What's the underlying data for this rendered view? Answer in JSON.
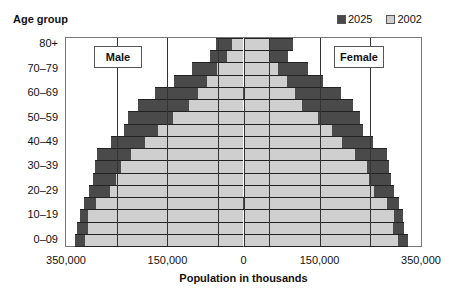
{
  "chart_data": {
    "type": "bar",
    "subtype": "population-pyramid",
    "title": "",
    "ylabel": "Age group",
    "xlabel": "Population in thousands",
    "x_ticks": [
      "350,000",
      "150,000",
      "0",
      "150,000",
      "350,000"
    ],
    "x_tick_values": [
      -350000,
      -150000,
      0,
      150000,
      350000
    ],
    "xlim": [
      -350000,
      350000
    ],
    "gridlines_at": [
      -250000,
      -150000,
      -50000,
      50000,
      150000,
      250000
    ],
    "y_tick_labels": [
      "80+",
      "70–79",
      "60–69",
      "50–59",
      "40–49",
      "30–39",
      "20–29",
      "10–19",
      "0–09"
    ],
    "side_labels": {
      "left": "Male",
      "right": "Female"
    },
    "legend": [
      {
        "name": "2025",
        "color": "#4a4a4a"
      },
      {
        "name": "2002",
        "color": "#cfcfcf"
      }
    ],
    "legend_position": "top-right",
    "categories_top_to_bottom": [
      "80+",
      "75–79",
      "70–74",
      "65–69",
      "60–64",
      "55–59",
      "50–54",
      "45–49",
      "40–44",
      "35–39",
      "30–34",
      "25–29",
      "20–24",
      "15–19",
      "10–14",
      "5–9",
      "0–4"
    ],
    "series": [
      {
        "name": "Male 2025",
        "values": [
          55,
          66,
          102,
          138,
          175,
          208,
          228,
          236,
          261,
          289,
          293,
          297,
          305,
          315,
          322,
          328,
          332
        ]
      },
      {
        "name": "Male 2002",
        "values": [
          22,
          33,
          53,
          71,
          90,
          108,
          140,
          169,
          195,
          222,
          242,
          252,
          263,
          291,
          307,
          307,
          313
        ]
      },
      {
        "name": "Female 2025",
        "values": [
          98,
          88,
          128,
          157,
          193,
          216,
          230,
          236,
          256,
          283,
          287,
          291,
          297,
          307,
          315,
          317,
          324
        ]
      },
      {
        "name": "Female 2002",
        "values": [
          51,
          51,
          69,
          86,
          102,
          116,
          147,
          175,
          195,
          220,
          244,
          248,
          258,
          283,
          297,
          295,
          305
        ]
      }
    ],
    "value_units": "thousands (×1000 = axis units shown)"
  },
  "header": {
    "ylabel": "Age group",
    "legend_2025": "2025",
    "legend_2002": "2002"
  },
  "footer": {
    "xlabel": "Population in thousands"
  }
}
